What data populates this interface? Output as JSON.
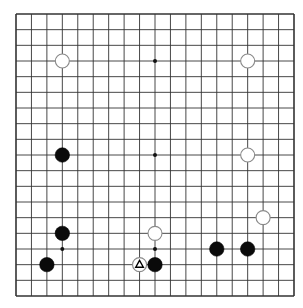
{
  "board": {
    "size": 19,
    "line_color": "#333333",
    "background": "#ffffff",
    "star_points": [
      [
        9,
        3
      ],
      [
        9,
        9
      ],
      [
        3,
        15
      ],
      [
        9,
        15
      ],
      [
        3,
        3
      ],
      [
        15,
        3
      ],
      [
        3,
        9
      ],
      [
        15,
        9
      ],
      [
        15,
        15
      ]
    ],
    "stones": [
      {
        "color": "white",
        "col": 3,
        "row": 3
      },
      {
        "color": "white",
        "col": 15,
        "row": 3
      },
      {
        "color": "black",
        "col": 3,
        "row": 9
      },
      {
        "color": "white",
        "col": 15,
        "row": 9
      },
      {
        "color": "white",
        "col": 16,
        "row": 13
      },
      {
        "color": "black",
        "col": 3,
        "row": 14
      },
      {
        "color": "white",
        "col": 9,
        "row": 14
      },
      {
        "color": "black",
        "col": 13,
        "row": 15
      },
      {
        "color": "black",
        "col": 15,
        "row": 15
      },
      {
        "color": "black",
        "col": 2,
        "row": 16
      },
      {
        "color": "white",
        "col": 8,
        "row": 16,
        "marker": "triangle"
      },
      {
        "color": "black",
        "col": 9,
        "row": 16
      }
    ]
  }
}
